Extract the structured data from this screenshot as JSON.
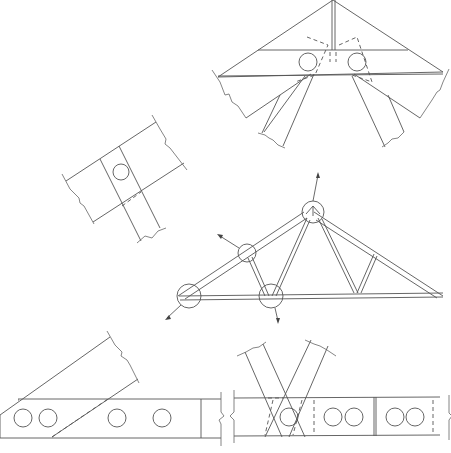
{
  "figure": {
    "stroke_color": "#555555",
    "background": "#ffffff"
  },
  "truss": {
    "type": "fink-style roof truss",
    "detail_circles": [
      "left-heel-joint",
      "top-chord-web-joint",
      "peak-joint",
      "bottom-chord-splice-joint"
    ]
  },
  "details": [
    {
      "id": "peak-joint-detail",
      "bolts": 2,
      "position": "top-right"
    },
    {
      "id": "top-chord-web-joint-detail",
      "bolts": 1,
      "position": "middle-left"
    },
    {
      "id": "heel-joint-detail",
      "bolts": 4,
      "position": "bottom-left"
    },
    {
      "id": "bottom-chord-splice-detail",
      "bolts": 5,
      "position": "bottom-right"
    }
  ]
}
